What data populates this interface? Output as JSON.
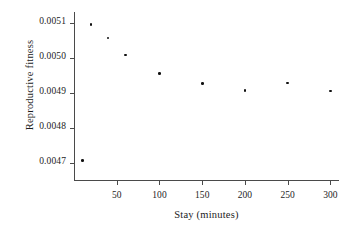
{
  "chart_data": {
    "type": "scatter",
    "title": "",
    "xlabel": "Stay (minutes)",
    "ylabel": "Reproductive fitness",
    "xlim": [
      0,
      310
    ],
    "ylim": [
      0.00465,
      0.00513
    ],
    "grid": false,
    "legend": null,
    "xticks": [
      50,
      100,
      150,
      200,
      250,
      300
    ],
    "xtick_labels": [
      "50",
      "100",
      "150",
      "200",
      "250",
      "300"
    ],
    "yticks": [
      0.0047,
      0.0048,
      0.0049,
      0.005,
      0.0051
    ],
    "ytick_labels": [
      "0.0047",
      "0.0048",
      "0.0049",
      "0.0050",
      "0.0051"
    ],
    "x": [
      10,
      20,
      40,
      60,
      100,
      150,
      200,
      250,
      300
    ],
    "y": [
      0.004705,
      0.005094,
      0.005056,
      0.005007,
      0.004955,
      0.004926,
      0.004906,
      0.004927,
      0.004904
    ],
    "points": [
      {
        "x": 10,
        "y": 0.004705
      },
      {
        "x": 20,
        "y": 0.005094
      },
      {
        "x": 40,
        "y": 0.005056
      },
      {
        "x": 60,
        "y": 0.005007
      },
      {
        "x": 100,
        "y": 0.004955
      },
      {
        "x": 150,
        "y": 0.004926
      },
      {
        "x": 200,
        "y": 0.004906
      },
      {
        "x": 250,
        "y": 0.004927
      },
      {
        "x": 300,
        "y": 0.004904
      }
    ],
    "marker": "dot",
    "marker_color": "#111111",
    "axis_color": "#4a4a4a",
    "background_color": "#ffffff"
  }
}
